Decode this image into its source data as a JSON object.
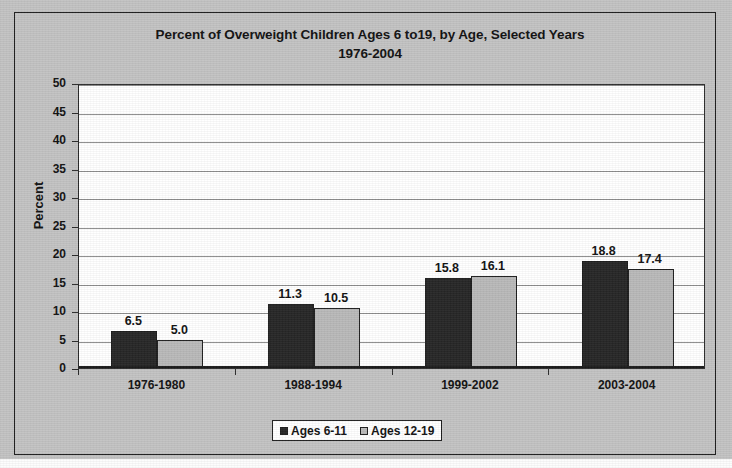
{
  "chart_data": {
    "type": "bar",
    "title": "Percent of Overweight Children Ages 6 to19, by Age, Selected Years",
    "subtitle": "1976-2004",
    "xlabel": "",
    "ylabel": "Percent",
    "ylim": [
      0,
      50
    ],
    "ytick_step": 5,
    "yticks": [
      50,
      45,
      40,
      35,
      30,
      25,
      20,
      15,
      10,
      5,
      0
    ],
    "grid": true,
    "legend_position": "bottom",
    "categories": [
      "1976-1980",
      "1988-1994",
      "1999-2002",
      "2003-2004"
    ],
    "series": [
      {
        "name": "Ages 6-11",
        "color": "#262626",
        "values": [
          6.5,
          5.0,
          15.8,
          18.8
        ],
        "labels": [
          "6.5",
          "11.3",
          "15.8",
          "18.8"
        ],
        "data": [
          6.5,
          11.3,
          15.8,
          18.8
        ]
      },
      {
        "name": "Ages 12-19",
        "color": "#b9b9b9",
        "values": [
          5.0,
          10.5,
          16.1,
          17.4
        ],
        "labels": [
          "5.0",
          "10.5",
          "16.1",
          "17.4"
        ],
        "data": [
          5.0,
          10.5,
          16.1,
          17.4
        ]
      }
    ]
  },
  "colors": {
    "background": "#c3c3c3",
    "plot_background": "#ffffff",
    "series_0": "#262626",
    "series_1": "#b9b9b9",
    "gridline": "#8d8d8d",
    "axis": "#1b1b1b",
    "text": "#111111"
  },
  "legend": {
    "entries": [
      {
        "label": "Ages 6-11"
      },
      {
        "label": "Ages 12-19"
      }
    ]
  }
}
